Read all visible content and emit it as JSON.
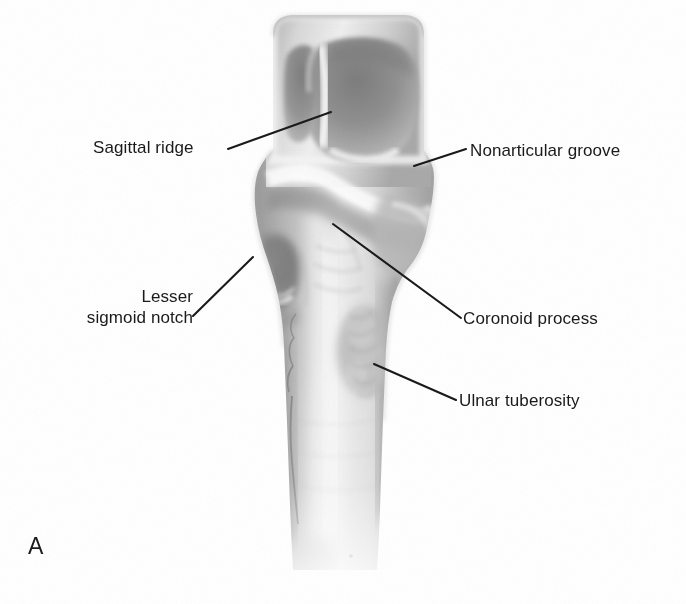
{
  "figure": {
    "panel_letter": "A",
    "background_color": "#ffffff",
    "line_color": "#1a1a1a",
    "text_color": "#1a1a1a"
  },
  "labels": {
    "sagittal_ridge": "Sagittal ridge",
    "nonarticular_groove": "Nonarticular groove",
    "lesser_sigmoid_notch_line1": "Lesser",
    "lesser_sigmoid_notch_line2": "sigmoid notch",
    "coronoid_process": "Coronoid process",
    "ulnar_tuberosity": "Ulnar tuberosity"
  },
  "leader_lines": [
    {
      "name": "sagittal-ridge-leader",
      "x1": 228,
      "y1": 149,
      "x2": 331,
      "y2": 112
    },
    {
      "name": "nonarticular-groove-leader",
      "x1": 466,
      "y1": 149,
      "x2": 414,
      "y2": 166
    },
    {
      "name": "lesser-sigmoid-notch-leader",
      "x1": 193,
      "y1": 316,
      "x2": 253,
      "y2": 257
    },
    {
      "name": "coronoid-process-leader",
      "x1": 333,
      "y1": 224,
      "x2": 461,
      "y2": 318
    },
    {
      "name": "ulnar-tuberosity-leader",
      "x1": 374,
      "y1": 364,
      "x2": 456,
      "y2": 400
    }
  ]
}
